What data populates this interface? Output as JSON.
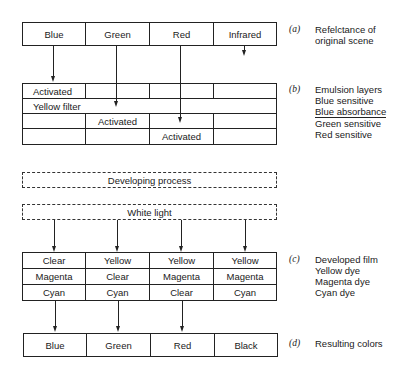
{
  "reflectance": {
    "cells": [
      "Blue",
      "Green",
      "Red",
      "Infrared"
    ],
    "tag": "(a)",
    "caption_lines": [
      "Refelctance of",
      "original scene"
    ]
  },
  "emulsion": {
    "row_blue": {
      "c0": "Activated"
    },
    "row_filter": {
      "label": "Yellow filter"
    },
    "row_green": {
      "c1": "Activated"
    },
    "row_red": {
      "c2": "Activated"
    },
    "tag": "(b)",
    "caption_lines": [
      "Emulsion layers",
      "Blue sensitive",
      "Blue absorbance",
      "Green sensitive",
      "Red sensitive"
    ]
  },
  "process": {
    "developing": "Developing process",
    "white_light": "White light"
  },
  "developed": {
    "rows": [
      [
        "Clear",
        "Yellow",
        "Yellow",
        "Yellow"
      ],
      [
        "Magenta",
        "Clear",
        "Magenta",
        "Magenta"
      ],
      [
        "Cyan",
        "Cyan",
        "Clear",
        "Cyan"
      ]
    ],
    "tag": "(c)",
    "caption_lines": [
      "Developed film",
      "Yellow dye",
      "Magenta dye",
      "Cyan dye"
    ]
  },
  "result": {
    "cells": [
      "Blue",
      "Green",
      "Red",
      "Black"
    ],
    "tag": "(d)",
    "caption": "Resulting colors"
  }
}
